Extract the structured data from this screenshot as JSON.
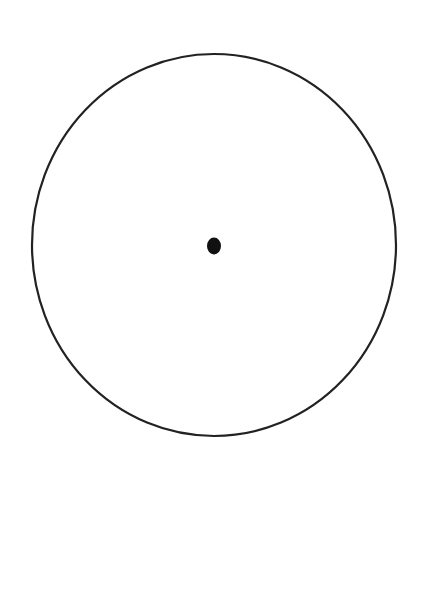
{
  "diagram": {
    "type": "circle-with-center-point",
    "background_color": "#ffffff",
    "stroke_color": "#222222",
    "circle": {
      "center_x": 214,
      "center_y": 245,
      "radius_x": 182,
      "radius_y": 191,
      "stroke_width": 2.2,
      "fill": "none"
    },
    "center_point": {
      "center_x": 214,
      "center_y": 246,
      "radius_x": 7,
      "radius_y": 8.5,
      "fill": "#111111"
    }
  }
}
